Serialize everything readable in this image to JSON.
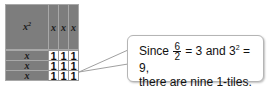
{
  "diagram": {
    "square_tile": {
      "label": "x",
      "exponent": "2"
    },
    "column_tiles": [
      "x",
      "x",
      "x"
    ],
    "row_tiles": [
      "x",
      "x",
      "x"
    ],
    "unit_tiles": [
      [
        "1",
        "1",
        "1"
      ],
      [
        "1",
        "1",
        "1"
      ],
      [
        "1",
        "1",
        "1"
      ]
    ],
    "colors": {
      "variable_tile": "#7d7d7d",
      "unit_tile": "#ffffff",
      "border": "#a8a8a8"
    }
  },
  "callout": {
    "since": "Since",
    "frac_num": "6",
    "frac_den": "2",
    "eq1": "= 3 and 3",
    "exp": "2",
    "eq2": "= 9,",
    "line2": "there are nine 1-tiles."
  }
}
